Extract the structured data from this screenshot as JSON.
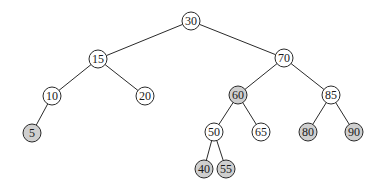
{
  "diagram": {
    "type": "binary-search-tree",
    "colors": {
      "background": "#ffffff",
      "edge": "#2a2a2a",
      "node_stroke": "#2a2a2a",
      "node_fill": "#ffffff",
      "node_fill_highlighted": "#cfcfcf",
      "text": "#1a1a1a"
    },
    "node_radius": 9,
    "nodes": [
      {
        "id": "n30",
        "label": "30",
        "x": 191,
        "y": 21,
        "highlighted": false
      },
      {
        "id": "n15",
        "label": "15",
        "x": 98,
        "y": 59,
        "highlighted": false
      },
      {
        "id": "n70",
        "label": "70",
        "x": 284,
        "y": 58,
        "highlighted": false
      },
      {
        "id": "n10",
        "label": "10",
        "x": 52,
        "y": 96,
        "highlighted": false
      },
      {
        "id": "n20",
        "label": "20",
        "x": 145,
        "y": 96,
        "highlighted": false
      },
      {
        "id": "n60",
        "label": "60",
        "x": 238,
        "y": 95,
        "highlighted": true
      },
      {
        "id": "n85",
        "label": "85",
        "x": 331,
        "y": 95,
        "highlighted": false
      },
      {
        "id": "n5",
        "label": "5",
        "x": 32,
        "y": 133,
        "highlighted": true
      },
      {
        "id": "n50",
        "label": "50",
        "x": 214,
        "y": 132,
        "highlighted": false
      },
      {
        "id": "n65",
        "label": "65",
        "x": 261,
        "y": 132,
        "highlighted": false
      },
      {
        "id": "n80",
        "label": "80",
        "x": 308,
        "y": 132,
        "highlighted": true
      },
      {
        "id": "n90",
        "label": "90",
        "x": 354,
        "y": 132,
        "highlighted": true
      },
      {
        "id": "n40",
        "label": "40",
        "x": 204,
        "y": 169,
        "highlighted": true
      },
      {
        "id": "n55",
        "label": "55",
        "x": 226,
        "y": 169,
        "highlighted": true
      }
    ],
    "edges": [
      {
        "from": "n30",
        "to": "n15"
      },
      {
        "from": "n30",
        "to": "n70"
      },
      {
        "from": "n15",
        "to": "n10"
      },
      {
        "from": "n15",
        "to": "n20"
      },
      {
        "from": "n70",
        "to": "n60"
      },
      {
        "from": "n70",
        "to": "n85"
      },
      {
        "from": "n10",
        "to": "n5"
      },
      {
        "from": "n60",
        "to": "n50"
      },
      {
        "from": "n60",
        "to": "n65"
      },
      {
        "from": "n85",
        "to": "n80"
      },
      {
        "from": "n85",
        "to": "n90"
      },
      {
        "from": "n50",
        "to": "n40"
      },
      {
        "from": "n50",
        "to": "n55"
      }
    ]
  }
}
